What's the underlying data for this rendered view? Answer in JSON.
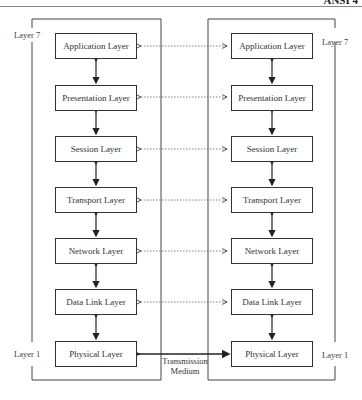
{
  "corner_text": "ANSI 4",
  "left_stack": {
    "top_label": "Layer 7",
    "bottom_label": "Layer 1",
    "layers": [
      {
        "label": "Application Layer"
      },
      {
        "label": "Presentation  Layer"
      },
      {
        "label": "Session Layer"
      },
      {
        "label": "Transport Layer"
      },
      {
        "label": "Network Layer"
      },
      {
        "label": "Data Link Layer"
      },
      {
        "label": "Physical Layer"
      }
    ]
  },
  "right_stack": {
    "top_label": "Layer 7",
    "bottom_label": "Layer 1",
    "layers": [
      {
        "label": "Application Layer"
      },
      {
        "label": "Presentation  Layer"
      },
      {
        "label": "Session Layer"
      },
      {
        "label": "Transport Layer"
      },
      {
        "label": "Network Layer"
      },
      {
        "label": "Data Link Layer"
      },
      {
        "label": "Physical Layer"
      }
    ]
  },
  "medium": {
    "line1": "Transmission",
    "line2": "Medium"
  }
}
